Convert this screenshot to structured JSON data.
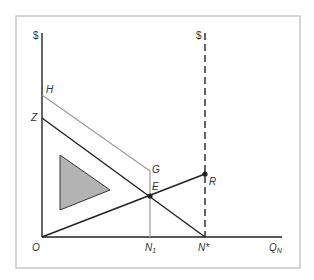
{
  "diagram": {
    "axes": {
      "left_y_label": "$",
      "right_y_label": "$",
      "x_label": "Q",
      "x_label_sub": "N",
      "origin_label": "O"
    },
    "points": {
      "H": "H",
      "Z": "Z",
      "G": "G",
      "E": "E",
      "R": "R",
      "N1": "N",
      "N1_sub": "1",
      "Nstar": "N*"
    },
    "colors": {
      "frame": "#bbbbbb",
      "axis": "#222222",
      "line_dark": "#222222",
      "line_gray": "#999999",
      "triangle_fill": "#b3b3b3",
      "label": "#333333"
    }
  }
}
